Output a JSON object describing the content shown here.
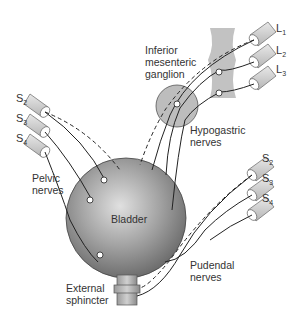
{
  "diagram": {
    "colors": {
      "bladder": "#8c8c8c",
      "bladder_highlight": "#d9d9d9",
      "ganglion": "#bdbdbd",
      "spinal_segment": "#c8c8c8",
      "line": "#222222"
    },
    "labels": {
      "inferior_mesenteric_ganglion": [
        "Inferior",
        "mesenteric",
        "ganglion"
      ],
      "hypogastric_nerves": [
        "Hypogastric",
        "nerves"
      ],
      "pelvic_nerves": [
        "Pelvic",
        "nerves"
      ],
      "bladder": "Bladder",
      "external_sphincter": [
        "External",
        "sphincter"
      ],
      "pudendal_nerves": [
        "Pudendal",
        "nerves"
      ]
    },
    "lumbar_roots": [
      {
        "letter": "L",
        "num": "1"
      },
      {
        "letter": "L",
        "num": "2"
      },
      {
        "letter": "L",
        "num": "3"
      }
    ],
    "sacral_roots_left": [
      {
        "letter": "S",
        "num": "2"
      },
      {
        "letter": "S",
        "num": "3"
      },
      {
        "letter": "S",
        "num": "4"
      }
    ],
    "sacral_roots_right": [
      {
        "letter": "S",
        "num": "2"
      },
      {
        "letter": "S",
        "num": "3"
      },
      {
        "letter": "S",
        "num": "4"
      }
    ]
  }
}
